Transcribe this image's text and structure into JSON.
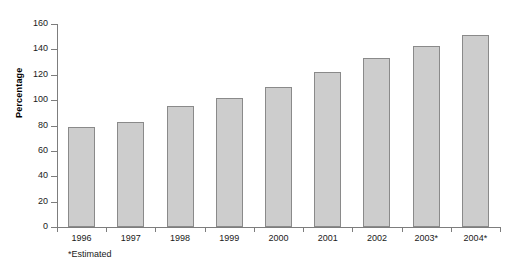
{
  "chart_data": {
    "type": "bar",
    "title": "",
    "xlabel": "",
    "ylabel": "Percentage",
    "categories": [
      "1996",
      "1997",
      "1998",
      "1999",
      "2000",
      "2001",
      "2002",
      "2003*",
      "2004*"
    ],
    "values": [
      79,
      83,
      95,
      102,
      110,
      122,
      133,
      143,
      151
    ],
    "ylim": [
      0,
      160
    ],
    "yticks": [
      0,
      20,
      40,
      60,
      80,
      100,
      120,
      140,
      160
    ],
    "ytick_labels": [
      "0",
      "20",
      "40",
      "60",
      "80",
      "100",
      "120",
      "140",
      "160"
    ],
    "grid": false,
    "legend": null,
    "annotations": [
      "*Estimated"
    ],
    "bar_color": "#cdcdcd",
    "bar_edge_color": "#8a8a8a",
    "axis_color": "#7d7d7d"
  },
  "footnote": "*Estimated"
}
